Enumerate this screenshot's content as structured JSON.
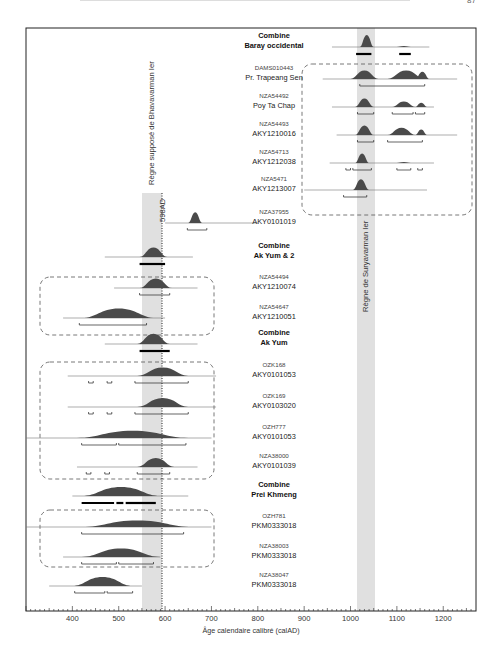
{
  "page": {
    "number": "87"
  },
  "chart_data": {
    "type": "area",
    "title": "",
    "xlabel": "Âge calendaire calibré (calAD)",
    "ylabel": "",
    "xlim": [
      300,
      1265
    ],
    "xticks": [
      400,
      500,
      600,
      700,
      800,
      900,
      1000,
      1100,
      1200
    ],
    "grid": false,
    "annotations": [
      {
        "text": "598AD",
        "x": 598,
        "kind": "dotted-vertical-line"
      },
      {
        "text": "Règne supposé de Bhavavarman Ier",
        "band": [
          555,
          598
        ]
      },
      {
        "text": "Règne de Suryavarman Ier",
        "band": [
          1010,
          1050
        ]
      }
    ],
    "rows": [
      {
        "id": "baray",
        "line1": "Combine",
        "line2": "Baray occidental",
        "combine": true,
        "side": "right",
        "line": [
          960,
          1170
        ],
        "peaks": [
          [
            1020,
            1050,
            1.0
          ],
          [
            1100,
            1130,
            0.08
          ]
        ],
        "ranges": [
          [
            1012,
            1045
          ],
          [
            1105,
            1130
          ]
        ]
      },
      {
        "id": "dams",
        "line1": "DAMS010443",
        "line2": "Pr. Trapeang Sen",
        "side": "right",
        "line": [
          940,
          1230
        ],
        "peaks": [
          [
            1000,
            1060,
            0.7
          ],
          [
            1080,
            1160,
            0.7
          ],
          [
            1140,
            1170,
            0.6
          ]
        ],
        "ranges": [
          [
            1020,
            1160
          ]
        ]
      },
      {
        "id": "nza54492",
        "line1": "NZA54492",
        "line2": "Poy Ta Chap",
        "side": "right",
        "line": [
          960,
          1180
        ],
        "peaks": [
          [
            1010,
            1050,
            0.7
          ],
          [
            1090,
            1140,
            0.45
          ],
          [
            1140,
            1165,
            0.35
          ]
        ],
        "ranges": [
          [
            1015,
            1050
          ],
          [
            1090,
            1135
          ],
          [
            1140,
            1160
          ]
        ]
      },
      {
        "id": "nza54493",
        "line1": "NZA54493",
        "line2": "AKY1210016",
        "side": "right",
        "line": [
          970,
          1230
        ],
        "peaks": [
          [
            1010,
            1050,
            0.8
          ],
          [
            1080,
            1140,
            0.6
          ],
          [
            1140,
            1165,
            0.45
          ]
        ],
        "ranges": [
          [
            1015,
            1050
          ],
          [
            1080,
            1155
          ]
        ]
      },
      {
        "id": "nza54713",
        "line1": "NZA54713",
        "line2": "AKY1212038",
        "side": "right",
        "line": [
          955,
          1180
        ],
        "peaks": [
          [
            1010,
            1040,
            0.8
          ],
          [
            1100,
            1130,
            0.08
          ]
        ],
        "ranges": [
          [
            990,
            1000
          ],
          [
            1005,
            1045
          ],
          [
            1100,
            1130
          ],
          [
            1145,
            1155
          ]
        ]
      },
      {
        "id": "nza5471",
        "line1": "NZA5471",
        "line2": "AKY1213007",
        "side": "right",
        "line": [
          900,
          1165
        ],
        "peaks": [
          [
            1005,
            1040,
            0.9
          ]
        ],
        "ranges": [
          [
            985,
            1035
          ]
        ]
      },
      {
        "id": "nza37955",
        "line1": "NZA37955",
        "line2": "AKY0101019",
        "side": "right",
        "line": [
          600,
          800
        ],
        "peaks": [
          [
            650,
            680,
            0.9
          ]
        ],
        "ranges": [
          [
            648,
            690
          ]
        ]
      },
      {
        "id": "akyum2",
        "line1": "Combine",
        "line2": "Ak Yum & 2",
        "combine": true,
        "side": "left",
        "line": [
          470,
          660
        ],
        "peaks": [
          [
            545,
            605,
            0.8
          ]
        ],
        "ranges": [
          [
            545,
            600
          ]
        ]
      },
      {
        "id": "nza54494",
        "line1": "NZA54494",
        "line2": "AKY1210074",
        "side": "left",
        "line": [
          490,
          670
        ],
        "peaks": [
          [
            545,
            615,
            0.8
          ]
        ],
        "ranges": [
          [
            545,
            610
          ]
        ]
      },
      {
        "id": "nza54647",
        "line1": "NZA54647",
        "line2": "AKY1210051",
        "side": "left",
        "line": [
          380,
          600
        ],
        "peaks": [
          [
            420,
            580,
            0.8
          ]
        ],
        "ranges": [
          [
            415,
            560
          ]
        ]
      },
      {
        "id": "akyum",
        "line1": "Combine",
        "line2": "Ak Yum",
        "combine": true,
        "side": "left",
        "line": [
          470,
          670
        ],
        "peaks": [
          [
            540,
            610,
            0.85
          ]
        ],
        "ranges": [
          [
            545,
            610
          ]
        ]
      },
      {
        "id": "ozk168",
        "line1": "OZK168",
        "line2": "AKY0101053",
        "side": "left",
        "line": [
          390,
          710
        ],
        "peaks": [
          [
            540,
            650,
            0.7
          ]
        ],
        "ranges": [
          [
            435,
            445
          ],
          [
            475,
            485
          ],
          [
            535,
            650
          ]
        ]
      },
      {
        "id": "ozk169",
        "line1": "OZK169",
        "line2": "AKY0103020",
        "side": "left",
        "line": [
          390,
          710
        ],
        "peaks": [
          [
            540,
            650,
            0.75
          ]
        ],
        "ranges": [
          [
            435,
            445
          ],
          [
            475,
            485
          ],
          [
            535,
            650
          ]
        ]
      },
      {
        "id": "ozh777",
        "line1": "OZH777",
        "line2": "AKY0101053",
        "side": "left",
        "line": [
          300,
          700
        ],
        "peaks": [
          [
            410,
            650,
            0.6
          ]
        ],
        "ranges": [
          [
            420,
            495
          ],
          [
            500,
            645
          ]
        ]
      },
      {
        "id": "nza38000",
        "line1": "NZA38000",
        "line2": "AKY0101039",
        "side": "left",
        "line": [
          410,
          670
        ],
        "peaks": [
          [
            540,
            620,
            0.75
          ]
        ],
        "ranges": [
          [
            430,
            440
          ],
          [
            470,
            480
          ],
          [
            540,
            610
          ]
        ]
      },
      {
        "id": "preikhmeng",
        "line1": "Combine",
        "line2": "Prei Khmeng",
        "combine": true,
        "side": "left",
        "line": [
          400,
          650
        ],
        "peaks": [
          [
            420,
            590,
            0.75
          ]
        ],
        "ranges": [
          [
            420,
            490
          ],
          [
            495,
            510
          ],
          [
            515,
            580
          ]
        ]
      },
      {
        "id": "ozh781",
        "line1": "OZH781",
        "line2": "PKM0333018",
        "side": "left",
        "line": [
          300,
          700
        ],
        "peaks": [
          [
            420,
            660,
            0.55
          ]
        ],
        "ranges": [
          [
            420,
            640
          ]
        ]
      },
      {
        "id": "nza38003",
        "line1": "NZA38003",
        "line2": "PKM0333018",
        "side": "left",
        "line": [
          380,
          590
        ],
        "peaks": [
          [
            420,
            590,
            0.7
          ]
        ],
        "ranges": [
          [
            420,
            495
          ],
          [
            500,
            575
          ]
        ]
      },
      {
        "id": "nza38047",
        "line1": "NZA38047",
        "line2": "PKM0333018",
        "side": "left",
        "line": [
          350,
          550
        ],
        "peaks": [
          [
            400,
            530,
            0.75
          ]
        ],
        "ranges": [
          [
            405,
            470
          ],
          [
            475,
            530
          ]
        ]
      }
    ]
  }
}
